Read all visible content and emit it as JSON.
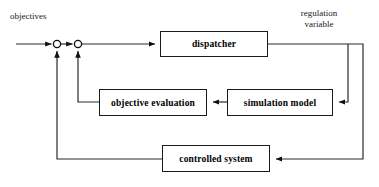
{
  "diagram": {
    "type": "control-system-block-diagram",
    "background_color": "#ffffff",
    "line_color": "#2b2b2b",
    "text_color": "#000000",
    "labels": {
      "objectives": "objectives",
      "regulation_variable_line1": "regulation",
      "regulation_variable_line2": "variable"
    },
    "blocks": [
      {
        "id": "dispatcher",
        "label": "dispatcher",
        "x": 160,
        "y": 31,
        "w": 108,
        "h": 26
      },
      {
        "id": "objective-evaluation",
        "label": "objective evaluation",
        "x": 99,
        "y": 89,
        "w": 108,
        "h": 27
      },
      {
        "id": "simulation-model",
        "label": "simulation model",
        "x": 227,
        "y": 89,
        "w": 106,
        "h": 27
      },
      {
        "id": "controlled-system",
        "label": "controlled system",
        "x": 162,
        "y": 145,
        "w": 108,
        "h": 27
      }
    ],
    "junctions": [
      {
        "id": "summing-junction-1",
        "cx": 57,
        "cy": 44,
        "r": 3.6
      },
      {
        "id": "summing-junction-2",
        "cx": 78,
        "cy": 44,
        "r": 3.6
      }
    ],
    "connections": [
      {
        "id": "objectives-input",
        "from": "left-edge",
        "to": "summing-junction-1"
      },
      {
        "id": "junction1-to-junction2",
        "from": "summing-junction-1",
        "to": "summing-junction-2"
      },
      {
        "id": "junction2-to-dispatcher",
        "from": "summing-junction-2",
        "to": "dispatcher"
      },
      {
        "id": "dispatcher-to-regulation-bus",
        "from": "dispatcher",
        "to": "regulation-variable-bus"
      },
      {
        "id": "regulation-bus-to-simulation-model",
        "from": "regulation-variable-bus",
        "to": "simulation-model"
      },
      {
        "id": "regulation-bus-to-controlled-system",
        "from": "regulation-variable-bus",
        "to": "controlled-system"
      },
      {
        "id": "simulation-model-to-objective-evaluation",
        "from": "simulation-model",
        "to": "objective-evaluation"
      },
      {
        "id": "objective-evaluation-feedback",
        "from": "objective-evaluation",
        "to": "summing-junction-2"
      },
      {
        "id": "controlled-system-feedback",
        "from": "controlled-system",
        "to": "summing-junction-1"
      }
    ]
  }
}
